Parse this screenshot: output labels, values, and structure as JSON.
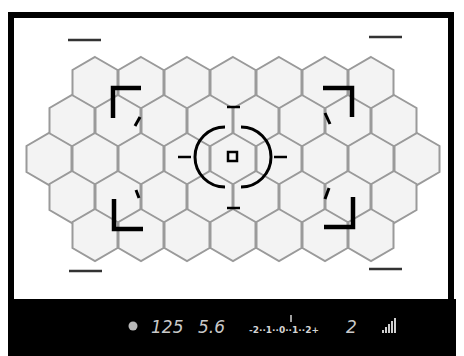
{
  "viewfinder": {
    "frame_color": "#000000",
    "grid_color": "#9a9a9a",
    "cell_fill": "#f3f3f3",
    "focus_grid": {
      "shape": "hexagon",
      "rows": [
        7,
        8,
        9,
        8,
        7
      ],
      "total_cells": 39
    },
    "center_focus_point": "square",
    "metering_circle": "center-weighted",
    "af_area_brackets": [
      "top-left",
      "top-right",
      "bottom-left",
      "bottom-right"
    ]
  },
  "info_bar": {
    "background": "#000000",
    "text_color": "#c9c9c9",
    "focus_indicator": "focus-confirm-dot",
    "shutter_speed": "125",
    "aperture": "5.6",
    "exposure_scale": {
      "label": "-2··1··0··1··2+",
      "indicator_position": "0"
    },
    "frame_count": "2",
    "battery_icon": "signal-bars-icon"
  }
}
